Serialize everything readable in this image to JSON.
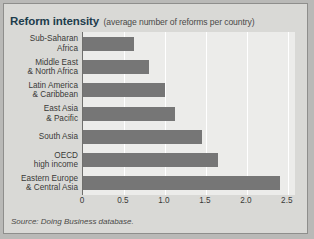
{
  "figure": {
    "title_main": "Reform intensity",
    "title_sub": "(average number of reforms per country)",
    "source": "Source: Doing Business database.",
    "colors": {
      "bar": "#767676",
      "plot_background": "#ececea",
      "figure_background": "#d9d9d6",
      "title_accent": "#1d3c4c",
      "gridline": "#ffffff",
      "axis_line": "#6f6f6d",
      "border": "#8e8e8c"
    }
  },
  "chart_data": {
    "type": "bar",
    "orientation": "horizontal",
    "title": "Reform intensity (average number of reforms per country)",
    "xlabel": "",
    "ylabel": "",
    "categories": [
      "Sub-Saharan\nAfrica",
      "Middle East\n& North Africa",
      "Latin America\n& Caribbean",
      "East Asia\n& Pacific",
      "South Asia",
      "OECD\nhigh income",
      "Eastern Europe\n& Central Asia"
    ],
    "values": [
      0.62,
      0.8,
      1.0,
      1.12,
      1.45,
      1.65,
      2.4
    ],
    "xlim": [
      0,
      2.6
    ],
    "xticks": [
      0,
      0.5,
      1.0,
      1.5,
      2.0,
      2.5
    ],
    "xtick_labels": [
      "0",
      "0.5",
      "1.0",
      "1.5",
      "2.0",
      "2.5"
    ],
    "grid": true,
    "legend": false
  }
}
